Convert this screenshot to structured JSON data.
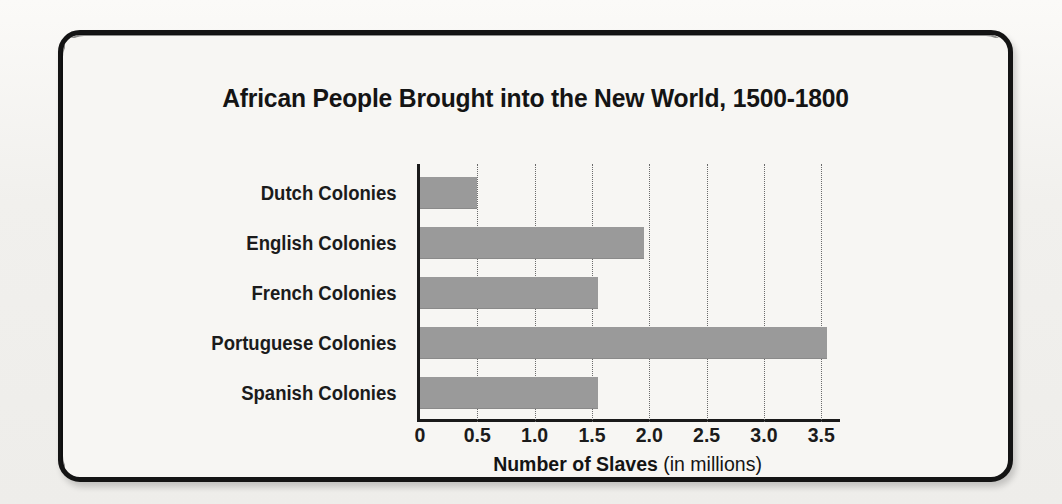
{
  "figure": {
    "title": "African People Brought into the New World, 1500-1800",
    "axis_title_bold": "Number of Slaves",
    "axis_title_regular": " (in millions)",
    "frame_color": "#141414",
    "bar_color": "#9a9a9a",
    "background_color": "#f4f3f0"
  },
  "chart_data": {
    "type": "bar",
    "orientation": "horizontal",
    "title": "African People Brought into the New World, 1500-1800",
    "xlabel": "Number of Slaves (in millions)",
    "ylabel": "",
    "categories": [
      "Dutch Colonies",
      "English Colonies",
      "French Colonies",
      "Portuguese Colonies",
      "Spanish Colonies"
    ],
    "values": [
      0.5,
      1.95,
      1.55,
      3.55,
      1.55
    ],
    "xlim": [
      0,
      3.62
    ],
    "xticks": [
      0,
      0.5,
      1.0,
      1.5,
      2.0,
      2.5,
      3.0,
      3.5
    ],
    "xtick_labels": [
      "0",
      "0.5",
      "1.0",
      "1.5",
      "2.0",
      "2.5",
      "3.0",
      "3.5"
    ],
    "grid": "vertical-dotted",
    "legend": "none",
    "series": [
      {
        "name": "Number of Slaves (in millions)",
        "values": [
          0.5,
          1.95,
          1.55,
          3.55,
          1.55
        ]
      }
    ]
  }
}
